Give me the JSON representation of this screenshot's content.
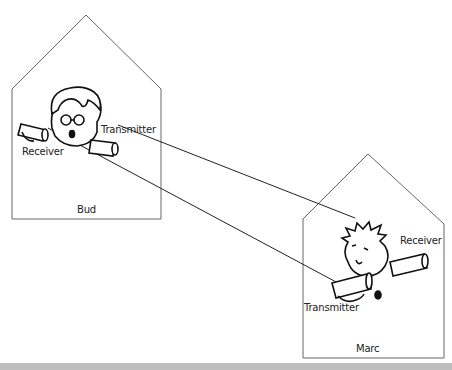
{
  "houses": {
    "left": {
      "name": "Bud",
      "labels": {
        "receiver": "Receiver",
        "transmitter": "Transmitter"
      }
    },
    "right": {
      "name": "Marc",
      "labels": {
        "receiver": "Receiver",
        "transmitter": "Transmitter"
      }
    }
  },
  "colors": {
    "line": "#555555",
    "ink": "#111111",
    "bar": "#bdbdbd"
  }
}
